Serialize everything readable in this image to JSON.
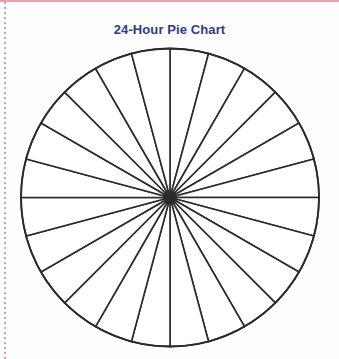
{
  "page": {
    "background_color": "#fefefe",
    "width": 339,
    "height": 359,
    "top_rule_color": "#e5a3ab",
    "left_margin_rule_color": "#e09aa4"
  },
  "title": {
    "text": "24-Hour Pie Chart",
    "color": "#2d3a8f"
  },
  "chart_data": {
    "type": "pie",
    "title": "24-Hour Pie Chart",
    "subtitle": "",
    "xlabel": "",
    "ylabel": "",
    "labels": [
      "1",
      "2",
      "3",
      "4",
      "5",
      "6",
      "7",
      "8",
      "9",
      "10",
      "11",
      "12",
      "13",
      "14",
      "15",
      "16",
      "17",
      "18",
      "19",
      "20",
      "21",
      "22",
      "23",
      "24"
    ],
    "values": [
      1,
      1,
      1,
      1,
      1,
      1,
      1,
      1,
      1,
      1,
      1,
      1,
      1,
      1,
      1,
      1,
      1,
      1,
      1,
      1,
      1,
      1,
      1,
      1
    ],
    "slice_count": 24,
    "slice_angle_degrees": 15,
    "total": 24,
    "unit": "hour",
    "blank_template": true,
    "slice_fill": "#ffffff",
    "stroke_color": "#2a2a28",
    "stroke_width": 1.6,
    "legend": "none",
    "grid": false,
    "data_labels": false,
    "start_angle_degrees": -90,
    "geometry": {
      "center_x": 170,
      "center_y": 197.5,
      "radius": 149
    }
  }
}
